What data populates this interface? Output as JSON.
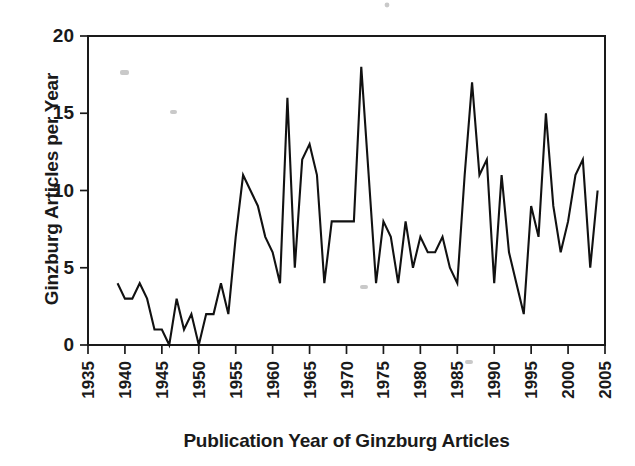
{
  "chart_data": {
    "type": "line",
    "title": "",
    "xlabel": "Publication Year of Ginzburg Articles",
    "ylabel": "Ginzburg Articles per Year",
    "xlim": [
      1935,
      2005
    ],
    "ylim": [
      0,
      20
    ],
    "xticks": [
      1935,
      1940,
      1945,
      1950,
      1955,
      1960,
      1965,
      1970,
      1975,
      1980,
      1985,
      1990,
      1995,
      2000,
      2005
    ],
    "yticks": [
      0,
      5,
      10,
      15,
      20
    ],
    "grid": false,
    "legend": "none",
    "line_color": "#111111",
    "x": [
      1939,
      1940,
      1941,
      1942,
      1943,
      1944,
      1945,
      1946,
      1947,
      1948,
      1949,
      1950,
      1951,
      1952,
      1953,
      1954,
      1955,
      1956,
      1957,
      1958,
      1959,
      1960,
      1961,
      1962,
      1963,
      1964,
      1965,
      1966,
      1967,
      1968,
      1969,
      1970,
      1971,
      1972,
      1973,
      1974,
      1975,
      1976,
      1977,
      1978,
      1979,
      1980,
      1981,
      1982,
      1983,
      1984,
      1985,
      1986,
      1987,
      1988,
      1989,
      1990,
      1991,
      1992,
      1993,
      1994,
      1995,
      1996,
      1997,
      1998,
      1999,
      2000,
      2001,
      2002,
      2003,
      2004
    ],
    "y": [
      4,
      3,
      3,
      4,
      3,
      1,
      1,
      0,
      3,
      1,
      2,
      0,
      2,
      2,
      4,
      2,
      7,
      11,
      10,
      9,
      7,
      6,
      4,
      16,
      5,
      12,
      13,
      11,
      4,
      8,
      8,
      8,
      8,
      18,
      11,
      4,
      8,
      7,
      4,
      8,
      5,
      7,
      6,
      6,
      7,
      5,
      4,
      11,
      17,
      11,
      12,
      4,
      11,
      6,
      4,
      2,
      9,
      7,
      15,
      9,
      6,
      8,
      11,
      12,
      5,
      10
    ]
  },
  "axes": {
    "y_title": "Ginzburg Articles per Year",
    "x_title": "Publication Year of Ginzburg Articles",
    "y_tick_labels": [
      "20",
      "15",
      "10",
      "5",
      "0"
    ],
    "x_tick_labels": [
      "1935",
      "1940",
      "1945",
      "1950",
      "1955",
      "1960",
      "1965",
      "1970",
      "1975",
      "1980",
      "1985",
      "1990",
      "1995",
      "2000",
      "2005"
    ]
  }
}
